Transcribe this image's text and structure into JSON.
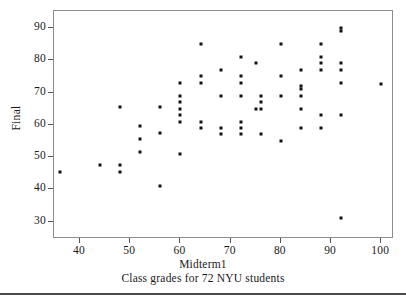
{
  "figure": {
    "xlabel": "Midterm1",
    "caption": "Class grades for 72 NYU students",
    "ylabel": "Final"
  },
  "chart_data": {
    "type": "scatter",
    "title": "",
    "subtitle": "",
    "xlabel": "Midterm1",
    "ylabel": "Final",
    "annotation": "Class grades for 72 NYU students",
    "xlim": [
      33,
      103
    ],
    "ylim": [
      28,
      93
    ],
    "xticks": [
      40,
      50,
      60,
      70,
      80,
      90,
      100
    ],
    "yticks": [
      30,
      40,
      50,
      60,
      70,
      80,
      90
    ],
    "grid": false,
    "legend": false,
    "marker": "square",
    "marker_color": "#111111",
    "n_points": 72,
    "points": [
      [
        36,
        45.5
      ],
      [
        44,
        47.5
      ],
      [
        48,
        65.5
      ],
      [
        48,
        47.5
      ],
      [
        48,
        45.5
      ],
      [
        52,
        59.5
      ],
      [
        52,
        55.5
      ],
      [
        52,
        51.5
      ],
      [
        56,
        65.5
      ],
      [
        56,
        57.5
      ],
      [
        56,
        41
      ],
      [
        60,
        73
      ],
      [
        60,
        69
      ],
      [
        60,
        67
      ],
      [
        60,
        65
      ],
      [
        60,
        63
      ],
      [
        60,
        61
      ],
      [
        60,
        51
      ],
      [
        64,
        85
      ],
      [
        64,
        75
      ],
      [
        64,
        73
      ],
      [
        64,
        61
      ],
      [
        64,
        59
      ],
      [
        68,
        77
      ],
      [
        68,
        69
      ],
      [
        68,
        59
      ],
      [
        68,
        57
      ],
      [
        72,
        81
      ],
      [
        72,
        75
      ],
      [
        72,
        73
      ],
      [
        72,
        69
      ],
      [
        72,
        61
      ],
      [
        72,
        59
      ],
      [
        72,
        57
      ],
      [
        75,
        79
      ],
      [
        75,
        65
      ],
      [
        76,
        69
      ],
      [
        76,
        67
      ],
      [
        76,
        65
      ],
      [
        76,
        57
      ],
      [
        80,
        85
      ],
      [
        80,
        75
      ],
      [
        80,
        69
      ],
      [
        80,
        55
      ],
      [
        84,
        77
      ],
      [
        84,
        72
      ],
      [
        84,
        71
      ],
      [
        84,
        69
      ],
      [
        84,
        65
      ],
      [
        84,
        59
      ],
      [
        88,
        85
      ],
      [
        88,
        81
      ],
      [
        88,
        79
      ],
      [
        88,
        77
      ],
      [
        88,
        63
      ],
      [
        88,
        59
      ],
      [
        92,
        90
      ],
      [
        92,
        89
      ],
      [
        92,
        79
      ],
      [
        92,
        77
      ],
      [
        92,
        73
      ],
      [
        92,
        63
      ],
      [
        92,
        31
      ],
      [
        100,
        72.5
      ]
    ]
  }
}
